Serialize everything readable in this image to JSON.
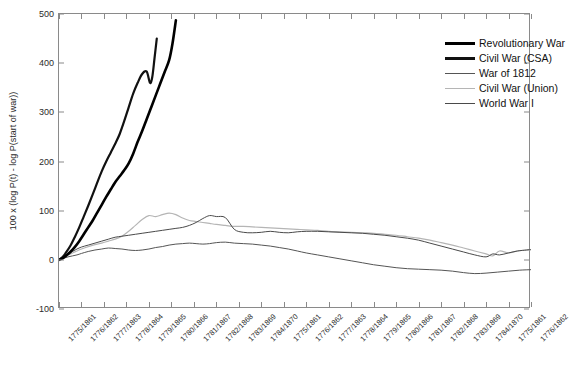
{
  "chart_data": {
    "type": "line",
    "title": "",
    "xlabel": "",
    "ylabel": "100 x (log P(t) - log P(start of war))",
    "ylim": [
      -100,
      500
    ],
    "yticks": [
      -100,
      0,
      100,
      200,
      300,
      400,
      500
    ],
    "grid": false,
    "legend_position": "top-right",
    "xticklabels": [
      "1775/1861",
      "1776/1862",
      "1777/1863",
      "1778/1864",
      "1779/1865",
      "1780/1866",
      "1781/1867",
      "1782/1868",
      "1783/1869",
      "1784/1870",
      "1775/1861",
      "1776/1862",
      "1777/1863",
      "1778/1864",
      "1779/1865",
      "1780/1866",
      "1781/1867",
      "1782/1868",
      "1783/1869",
      "1784/1870",
      "1775/1861",
      "1776/1862"
    ],
    "xlim": [
      0,
      21
    ],
    "series": [
      {
        "name": "Revolutionary War",
        "color": "#000000",
        "width": 2.6,
        "x": [
          0,
          0.15,
          0.3,
          0.5,
          0.7,
          0.9,
          1.1,
          1.3,
          1.5,
          1.7,
          1.9,
          2.1,
          2.3,
          2.5,
          2.7,
          2.9,
          3.1,
          3.3,
          3.5,
          3.7,
          3.9,
          4.1,
          4.3,
          4.5,
          4.7,
          4.9,
          5.05,
          5.2
        ],
        "y": [
          0,
          3,
          8,
          16,
          26,
          38,
          52,
          66,
          80,
          96,
          112,
          128,
          143,
          158,
          170,
          182,
          196,
          216,
          240,
          262,
          286,
          310,
          334,
          358,
          382,
          406,
          440,
          487
        ]
      },
      {
        "name": "Civil War (CSA)",
        "color": "#111111",
        "width": 2.2,
        "x": [
          0,
          0.15,
          0.3,
          0.5,
          0.7,
          0.9,
          1.1,
          1.3,
          1.5,
          1.7,
          1.9,
          2.1,
          2.3,
          2.5,
          2.7,
          2.9,
          3.1,
          3.3,
          3.5,
          3.7,
          3.9,
          4.05,
          4.15,
          4.25,
          4.35
        ],
        "y": [
          0,
          5,
          14,
          28,
          46,
          66,
          88,
          110,
          133,
          157,
          180,
          200,
          218,
          236,
          256,
          282,
          310,
          338,
          360,
          378,
          383,
          360,
          372,
          410,
          450
        ]
      },
      {
        "name": "War of 1812",
        "color": "#555555",
        "width": 1.0,
        "x": [
          0,
          0.2,
          0.4,
          0.6,
          0.8,
          1.0,
          1.3,
          1.6,
          1.9,
          2.2,
          2.5,
          2.8,
          3.1,
          3.4,
          3.7,
          4.0,
          4.3,
          4.6,
          4.9,
          5.2,
          5.5,
          5.8,
          6.1,
          6.4,
          6.7,
          7.0,
          7.4,
          7.8,
          8.2,
          8.6,
          9.0,
          9.4,
          9.8,
          10.2,
          10.6,
          11.0,
          11.5,
          12.0,
          12.5,
          13.0,
          13.5,
          14.0,
          14.5,
          15.0,
          15.5,
          16.0,
          16.5,
          17.0,
          17.5,
          18.0,
          18.5,
          19.0,
          19.5,
          20.0,
          20.5,
          21.0
        ],
        "y": [
          0,
          3,
          6,
          8,
          10,
          13,
          17,
          20,
          22,
          24,
          23,
          22,
          20,
          19,
          20,
          22,
          25,
          27,
          30,
          32,
          33,
          34,
          33,
          32,
          33,
          35,
          36,
          34,
          33,
          32,
          30,
          28,
          25,
          22,
          18,
          14,
          10,
          6,
          2,
          -2,
          -6,
          -10,
          -13,
          -16,
          -18,
          -19,
          -20,
          -21,
          -23,
          -26,
          -28,
          -27,
          -25,
          -23,
          -21,
          -20
        ]
      },
      {
        "name": "Civil War (Union)",
        "color": "#b5b5b5",
        "width": 1.2,
        "x": [
          0,
          0.2,
          0.4,
          0.6,
          0.8,
          1.0,
          1.3,
          1.6,
          1.9,
          2.2,
          2.5,
          2.8,
          3.1,
          3.4,
          3.7,
          4.0,
          4.3,
          4.6,
          4.9,
          5.2,
          5.5,
          5.8,
          6.1,
          6.4,
          6.7,
          7.0,
          7.4,
          7.8,
          8.2,
          8.6,
          9.0,
          9.4,
          9.8,
          10.2,
          10.6,
          11.0,
          11.5,
          12.0,
          12.5,
          13.0,
          13.5,
          14.0,
          14.5,
          15.0,
          15.5,
          16.0,
          16.5,
          17.0,
          17.5,
          18.0,
          18.5,
          19.0,
          19.3,
          19.6,
          20.0,
          20.4,
          20.8,
          21.0
        ],
        "y": [
          0,
          4,
          9,
          14,
          18,
          22,
          27,
          31,
          34,
          38,
          42,
          48,
          58,
          70,
          82,
          90,
          88,
          92,
          95,
          92,
          85,
          80,
          78,
          76,
          74,
          72,
          70,
          68,
          68,
          67,
          66,
          65,
          64,
          63,
          62,
          61,
          60,
          58,
          57,
          56,
          55,
          54,
          52,
          50,
          47,
          44,
          40,
          35,
          30,
          24,
          18,
          12,
          8,
          18,
          14,
          18,
          20,
          20
        ]
      },
      {
        "name": "World War I",
        "color": "#4a4a4a",
        "width": 1.0,
        "x": [
          0,
          0.2,
          0.4,
          0.6,
          0.8,
          1.0,
          1.3,
          1.6,
          1.9,
          2.2,
          2.5,
          2.8,
          3.1,
          3.4,
          3.7,
          4.0,
          4.3,
          4.6,
          4.9,
          5.2,
          5.5,
          5.8,
          6.1,
          6.4,
          6.7,
          7.0,
          7.4,
          7.8,
          8.2,
          8.6,
          9.0,
          9.4,
          9.8,
          10.2,
          10.6,
          11.0,
          11.5,
          12.0,
          12.5,
          13.0,
          13.5,
          14.0,
          14.5,
          15.0,
          15.5,
          16.0,
          16.5,
          17.0,
          17.5,
          18.0,
          18.5,
          19.0,
          19.3,
          19.6,
          20.0,
          20.4,
          20.8,
          21.0
        ],
        "y": [
          0,
          5,
          11,
          17,
          22,
          26,
          30,
          34,
          38,
          42,
          46,
          48,
          50,
          52,
          54,
          56,
          58,
          60,
          62,
          64,
          66,
          70,
          76,
          84,
          90,
          88,
          86,
          62,
          56,
          55,
          56,
          58,
          56,
          55,
          57,
          58,
          58,
          57,
          56,
          55,
          54,
          52,
          50,
          47,
          44,
          40,
          34,
          28,
          22,
          16,
          10,
          6,
          12,
          10,
          14,
          18,
          20,
          21
        ]
      }
    ]
  },
  "legend": {
    "items": [
      {
        "label": "Revolutionary War"
      },
      {
        "label": "Civil War (CSA)"
      },
      {
        "label": "War of 1812"
      },
      {
        "label": "Civil War (Union)"
      },
      {
        "label": "World War I"
      }
    ]
  }
}
